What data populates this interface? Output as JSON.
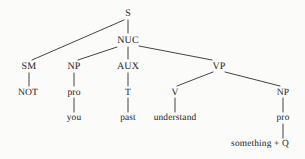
{
  "diagram": {
    "kind": "syntax-tree",
    "title": "",
    "sentence": "NOT you past understand something + Q",
    "ink_color": "#25221f",
    "background_color": "#fbfbfa",
    "nodes": [
      {
        "id": "S",
        "label": "S",
        "x": 128,
        "y": 13,
        "level": 0,
        "class": ""
      },
      {
        "id": "NUC",
        "label": "NUC",
        "x": 128,
        "y": 40,
        "level": 1,
        "class": ""
      },
      {
        "id": "SM",
        "label": "SM",
        "x": 29,
        "y": 66,
        "level": 2,
        "class": ""
      },
      {
        "id": "NP1",
        "label": "NP",
        "x": 74,
        "y": 66,
        "level": 2,
        "class": ""
      },
      {
        "id": "AUX",
        "label": "AUX",
        "x": 128,
        "y": 66,
        "level": 2,
        "class": ""
      },
      {
        "id": "VP",
        "label": "VP",
        "x": 219,
        "y": 66,
        "level": 2,
        "class": ""
      },
      {
        "id": "NOT",
        "label": "NOT",
        "x": 28,
        "y": 92,
        "level": 3,
        "class": "terminal"
      },
      {
        "id": "pro1",
        "label": "pro",
        "x": 74,
        "y": 92,
        "level": 3,
        "class": "terminal"
      },
      {
        "id": "T",
        "label": "T",
        "x": 128,
        "y": 92,
        "level": 3,
        "class": "terminal"
      },
      {
        "id": "V",
        "label": "V",
        "x": 175,
        "y": 92,
        "level": 3,
        "class": "terminal"
      },
      {
        "id": "NP2",
        "label": "NP",
        "x": 283,
        "y": 92,
        "level": 3,
        "class": "terminal"
      },
      {
        "id": "you",
        "label": "you",
        "x": 74,
        "y": 118,
        "level": 4,
        "class": "lex"
      },
      {
        "id": "past",
        "label": "past",
        "x": 128,
        "y": 118,
        "level": 4,
        "class": "lex"
      },
      {
        "id": "understand",
        "label": "understand",
        "x": 175,
        "y": 118,
        "level": 4,
        "class": "lex"
      },
      {
        "id": "pro2",
        "label": "pro",
        "x": 283,
        "y": 118,
        "level": 4,
        "class": "lex"
      },
      {
        "id": "somethingQ",
        "label": "something + Q",
        "x": 260,
        "y": 144,
        "level": 5,
        "class": "lex"
      }
    ],
    "edges": [
      {
        "from": "S",
        "to": "SM",
        "x1": 124,
        "y1": 20,
        "x2": 32,
        "y2": 60
      },
      {
        "from": "S",
        "to": "NUC",
        "x1": 128,
        "y1": 20,
        "x2": 128,
        "y2": 33
      },
      {
        "from": "NUC",
        "to": "NP1",
        "x1": 117,
        "y1": 47,
        "x2": 78,
        "y2": 60
      },
      {
        "from": "NUC",
        "to": "AUX",
        "x1": 128,
        "y1": 47,
        "x2": 128,
        "y2": 59
      },
      {
        "from": "NUC",
        "to": "VP",
        "x1": 139,
        "y1": 46,
        "x2": 212,
        "y2": 60
      },
      {
        "from": "SM",
        "to": "NOT",
        "x1": 29,
        "y1": 73,
        "x2": 29,
        "y2": 86
      },
      {
        "from": "NP1",
        "to": "pro1",
        "x1": 74,
        "y1": 73,
        "x2": 74,
        "y2": 86
      },
      {
        "from": "AUX",
        "to": "T",
        "x1": 128,
        "y1": 73,
        "x2": 128,
        "y2": 86
      },
      {
        "from": "VP",
        "to": "V",
        "x1": 213,
        "y1": 72,
        "x2": 177,
        "y2": 86
      },
      {
        "from": "VP",
        "to": "NP2",
        "x1": 225,
        "y1": 72,
        "x2": 280,
        "y2": 86
      },
      {
        "from": "pro1",
        "to": "you",
        "x1": 74,
        "y1": 98,
        "x2": 74,
        "y2": 112
      },
      {
        "from": "T",
        "to": "past",
        "x1": 128,
        "y1": 98,
        "x2": 128,
        "y2": 112
      },
      {
        "from": "V",
        "to": "understand",
        "x1": 175,
        "y1": 98,
        "x2": 175,
        "y2": 112
      },
      {
        "from": "NP2",
        "to": "pro2",
        "x1": 283,
        "y1": 98,
        "x2": 283,
        "y2": 112
      },
      {
        "from": "pro2",
        "to": "somethingQ",
        "x1": 283,
        "y1": 124,
        "x2": 283,
        "y2": 138
      }
    ]
  }
}
